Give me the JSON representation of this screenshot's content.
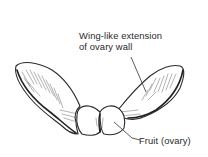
{
  "diagram": {
    "labels": [
      {
        "id": "wing",
        "lines": [
          "Wing-like extension",
          "of ovary wall"
        ]
      },
      {
        "id": "fruit",
        "lines": [
          "Fruit (ovary)"
        ]
      }
    ],
    "colors": {
      "background": "#ffffff",
      "ink": "#2b2b2b",
      "text": "#2a2a2a"
    }
  }
}
